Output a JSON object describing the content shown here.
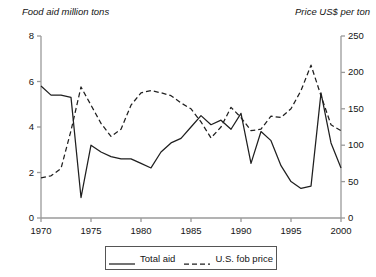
{
  "chart_data": {
    "type": "line",
    "title": "",
    "xlabel": "",
    "ylabel": "Food aid million tons",
    "y2label": "Price US$ per ton",
    "grid": false,
    "legend_position": "bottom-center",
    "xlim": [
      1970,
      2000
    ],
    "ylim": [
      0,
      8
    ],
    "y2lim": [
      0,
      250
    ],
    "x_ticks": [
      "1970",
      "1975",
      "1980",
      "1985",
      "1990",
      "1995",
      "2000"
    ],
    "y_ticks": [
      "0",
      "2",
      "4",
      "6",
      "8"
    ],
    "y2_ticks": [
      "0",
      "50",
      "100",
      "150",
      "200",
      "250"
    ],
    "x": [
      1970,
      1971,
      1972,
      1973,
      1974,
      1975,
      1976,
      1977,
      1978,
      1979,
      1980,
      1981,
      1982,
      1983,
      1984,
      1985,
      1986,
      1987,
      1988,
      1989,
      1990,
      1991,
      1992,
      1993,
      1994,
      1995,
      1996,
      1997,
      1998,
      1999,
      2000
    ],
    "series": [
      {
        "name": "Total aid",
        "axis": "left",
        "style": "solid",
        "units": "million tons",
        "values": [
          5.8,
          5.4,
          5.4,
          5.3,
          0.9,
          3.2,
          2.9,
          2.7,
          2.6,
          2.6,
          2.4,
          2.2,
          2.9,
          3.3,
          3.5,
          4.0,
          4.5,
          4.1,
          4.3,
          3.9,
          4.6,
          2.4,
          3.8,
          3.4,
          2.3,
          1.6,
          1.3,
          1.4,
          5.5,
          3.3,
          2.2
        ]
      },
      {
        "name": "U.S. fob price",
        "axis": "right",
        "style": "dashed",
        "units": "US$ per ton",
        "values": [
          55,
          58,
          68,
          120,
          180,
          155,
          130,
          112,
          122,
          155,
          172,
          175,
          172,
          168,
          158,
          150,
          132,
          110,
          125,
          152,
          138,
          120,
          122,
          140,
          138,
          150,
          175,
          210,
          168,
          128,
          120
        ]
      }
    ]
  },
  "legend": {
    "entries": [
      {
        "label": "Total aid",
        "style": "solid"
      },
      {
        "label": "U.S. fob price",
        "style": "dashed"
      }
    ]
  }
}
